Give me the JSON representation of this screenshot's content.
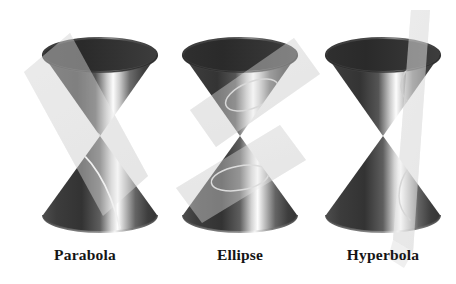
{
  "figure": {
    "background_color": "#ffffff",
    "width": 456,
    "height": 284,
    "panel_count": 3
  },
  "palette": {
    "background": "#ffffff",
    "plane_fill": "#e6e6e6",
    "plane_fill_light": "#ededed",
    "plane_edge": "#dcdcdc",
    "cone_dark": "#3a3a3a",
    "cone_darkest": "#232323",
    "cone_mid": "#6f6f6f",
    "cone_highlight": "#fdfdfd",
    "cone_interior_dark": "#2a2a2a",
    "cone_rim": "#1c1c1c",
    "curve_stroke": "#f2f2f2",
    "label_color": "#151515"
  },
  "panels": [
    {
      "id": "parabola",
      "label": "Parabola",
      "curve_name": "parabola",
      "description": "Double cone cut by a plane parallel to one generator, producing an open parabolic curve on the lower nappe.",
      "plane_orientation": "tilted",
      "plane_rotation_deg": -22,
      "nappes_cut": 1,
      "curve_count": 1,
      "center_x": 100,
      "apex_x": 100,
      "apex_y": 136,
      "cone_top_y": 38,
      "cone_bottom_y": 232,
      "rim_radius_x": 57,
      "rim_radius_y": 17
    },
    {
      "id": "ellipse",
      "label": "Ellipse",
      "curve_name": "ellipse",
      "description": "Double cone cut by planes oblique to the axis but steeper than the generators, producing closed elliptical curves on each nappe.",
      "plane_orientation": "oblique",
      "plane_rotation_deg": -20,
      "nappes_cut": 2,
      "curve_count": 2,
      "center_x": 240,
      "apex_x": 240,
      "apex_y": 136,
      "cone_top_y": 38,
      "cone_bottom_y": 232,
      "rim_radius_x": 57,
      "rim_radius_y": 17
    },
    {
      "id": "hyperbola",
      "label": "Hyperbola",
      "curve_name": "hyperbola",
      "description": "Double cone cut by a near-vertical plane parallel to the axis, producing two opposing hyperbolic branches, one on each nappe.",
      "plane_orientation": "near-vertical",
      "plane_rotation_deg": -5,
      "nappes_cut": 2,
      "curve_count": 2,
      "center_x": 383,
      "apex_x": 383,
      "apex_y": 136,
      "cone_top_y": 38,
      "cone_bottom_y": 232,
      "rim_radius_x": 57,
      "rim_radius_y": 17
    }
  ],
  "captions": {
    "parabola": "Parabola",
    "ellipse": "Ellipse",
    "hyperbola": "Hyperbola"
  }
}
